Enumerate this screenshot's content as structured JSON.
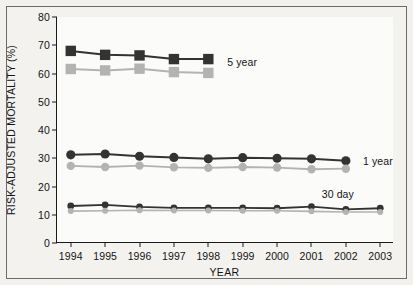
{
  "chart_data": {
    "type": "line",
    "title": "",
    "xlabel": "YEAR",
    "ylabel": "RISK-ADJUSTED MORTALITY (%)",
    "categories": [
      "1994",
      "1995",
      "1996",
      "1997",
      "1998",
      "1999",
      "2000",
      "2001",
      "2002",
      "2003"
    ],
    "x": [
      1994,
      1995,
      1996,
      1997,
      1998,
      1999,
      2000,
      2001,
      2002,
      2003
    ],
    "xlim": [
      1993.6,
      2003.4
    ],
    "ylim": [
      0,
      80
    ],
    "yticks": [
      0,
      10,
      20,
      30,
      40,
      50,
      60,
      70,
      80
    ],
    "ytick_labels": [
      "0",
      "10",
      "20",
      "30",
      "40",
      "50",
      "60",
      "70",
      "80"
    ],
    "grid": false,
    "legend_position": "inline-right",
    "annotations": [
      {
        "text": "5 year",
        "x": 1998.55,
        "y": 64.0
      },
      {
        "text": "1 year",
        "x": 2002.5,
        "y": 29.0
      },
      {
        "text": "30 day",
        "x": 2001.3,
        "y": 17.5
      }
    ],
    "series": [
      {
        "name": "5 year (dark)",
        "label": "5 year",
        "color": "#333333",
        "marker": "square",
        "marker_size": 5.2,
        "line_width": 2.0,
        "x": [
          1994,
          1995,
          1996,
          1997,
          1998
        ],
        "values": [
          68.0,
          66.6,
          66.4,
          65.1,
          65.1
        ]
      },
      {
        "name": "5 year (light)",
        "label": "5 year",
        "color": "#b3b3b3",
        "marker": "square",
        "marker_size": 5.2,
        "line_width": 2.0,
        "x": [
          1994,
          1995,
          1996,
          1997,
          1998
        ],
        "values": [
          61.6,
          61.1,
          61.7,
          60.5,
          60.2
        ]
      },
      {
        "name": "1 year (dark)",
        "label": "1 year",
        "color": "#333333",
        "marker": "circle",
        "marker_size": 4.6,
        "line_width": 2.0,
        "x": [
          1994,
          1995,
          1996,
          1997,
          1998,
          1999,
          2000,
          2001,
          2002
        ],
        "values": [
          31.2,
          31.5,
          30.7,
          30.3,
          29.8,
          30.2,
          30.0,
          29.8,
          29.1
        ]
      },
      {
        "name": "1 year (light)",
        "label": "1 year",
        "color": "#b3b3b3",
        "marker": "circle",
        "marker_size": 4.2,
        "line_width": 1.8,
        "x": [
          1994,
          1995,
          1996,
          1997,
          1998,
          1999,
          2000,
          2001,
          2002
        ],
        "values": [
          27.3,
          26.9,
          27.4,
          26.8,
          26.6,
          26.9,
          26.7,
          26.1,
          26.3
        ]
      },
      {
        "name": "30 day (dark)",
        "label": "30 day",
        "color": "#333333",
        "marker": "circle",
        "marker_size": 3.4,
        "line_width": 1.8,
        "x": [
          1994,
          1995,
          1996,
          1997,
          1998,
          1999,
          2000,
          2001,
          2002,
          2003
        ],
        "values": [
          13.1,
          13.5,
          12.8,
          12.4,
          12.4,
          12.4,
          12.3,
          12.9,
          11.9,
          12.3
        ]
      },
      {
        "name": "30 day (light)",
        "label": "30 day",
        "color": "#b3b3b3",
        "marker": "circle",
        "marker_size": 3.0,
        "line_width": 1.6,
        "x": [
          1994,
          1995,
          1996,
          1997,
          1998,
          1999,
          2000,
          2001,
          2002,
          2003
        ],
        "values": [
          11.3,
          11.4,
          11.6,
          11.5,
          11.5,
          11.4,
          11.4,
          11.2,
          11.0,
          11.0
        ]
      }
    ]
  }
}
